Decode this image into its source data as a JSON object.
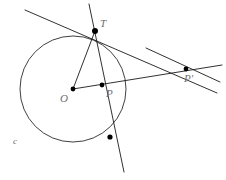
{
  "figure": {
    "kind": "geometry-diagram",
    "width": 226,
    "height": 180,
    "background": "#ffffff",
    "stroke_color": "#1a1a1a",
    "label_color": "#6e6e6e"
  },
  "labels": {
    "tangency_point": "T",
    "center": "O",
    "inner_point": "P",
    "outer_point": "P'",
    "circle": "c"
  },
  "chart_data": {
    "type": "diagram",
    "title": "",
    "circle": {
      "name": "c",
      "center": {
        "x": 73,
        "y": 89
      },
      "radius": 53
    },
    "points": [
      {
        "name": "T",
        "x": 95,
        "y": 31,
        "marker": true,
        "label_dx": 7,
        "label_dy": -10
      },
      {
        "name": "O",
        "x": 73,
        "y": 89,
        "marker": true,
        "label_dx": -11,
        "label_dy": 9
      },
      {
        "name": "P",
        "x": 102,
        "y": 85,
        "marker": true,
        "label_dx": 6,
        "label_dy": 9
      },
      {
        "name": "P'",
        "x": 186,
        "y": 69,
        "marker": true,
        "label_dx": 2,
        "label_dy": 10
      },
      {
        "name": "",
        "x": 110,
        "y": 137,
        "marker": true,
        "label_dx": 0,
        "label_dy": 0
      }
    ],
    "segments": [
      {
        "name": "radius-OT",
        "x1": 73,
        "y1": 89,
        "x2": 95,
        "y2": 31
      },
      {
        "name": "ray-O-to-Pprime",
        "x1": 73,
        "y1": 89,
        "x2": 222,
        "y2": 65
      },
      {
        "name": "tangent-at-T",
        "x1": 25,
        "y1": 10,
        "x2": 217,
        "y2": 93
      },
      {
        "name": "chord-through-T",
        "x1": 89,
        "y1": 4,
        "x2": 124,
        "y2": 172
      },
      {
        "name": "secant-Pprime",
        "x1": 146,
        "y1": 48,
        "x2": 220,
        "y2": 82
      }
    ],
    "axis": {
      "visible": false
    },
    "grid": false,
    "legend": {
      "visible": false
    }
  }
}
